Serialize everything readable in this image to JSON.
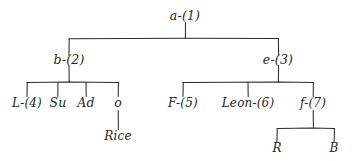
{
  "diagram": {
    "style": "handwritten pen on white paper",
    "ink_color": "#262626",
    "background_color": "#ffffff",
    "nodes": [
      {
        "id": "n1",
        "label": "a-(1)",
        "x": 185,
        "y": 16,
        "level": 0
      },
      {
        "id": "n2",
        "label": "b-(2)",
        "x": 69,
        "y": 60,
        "level": 1
      },
      {
        "id": "n3",
        "label": "e-(3)",
        "x": 278,
        "y": 60,
        "level": 1
      },
      {
        "id": "n4",
        "label": "L-(4)",
        "x": 27,
        "y": 103,
        "level": 2
      },
      {
        "id": "n5",
        "label": "Su",
        "x": 58,
        "y": 103,
        "level": 2
      },
      {
        "id": "n6",
        "label": "Ad",
        "x": 86,
        "y": 103,
        "level": 2
      },
      {
        "id": "n7",
        "label": "o",
        "x": 118,
        "y": 103,
        "level": 2
      },
      {
        "id": "n8",
        "label": "Rice",
        "x": 118,
        "y": 140,
        "level": 3
      },
      {
        "id": "n9",
        "label": "F-(5)",
        "x": 183,
        "y": 103,
        "level": 2
      },
      {
        "id": "n10",
        "label": "Leon-(6)",
        "x": 248,
        "y": 103,
        "level": 2
      },
      {
        "id": "n11",
        "label": "f-(7)",
        "x": 313,
        "y": 103,
        "level": 2
      },
      {
        "id": "n12",
        "label": "R",
        "x": 277,
        "y": 148,
        "level": 3
      },
      {
        "id": "n13",
        "label": "B",
        "x": 334,
        "y": 148,
        "level": 3
      }
    ],
    "edges": [
      {
        "from": "n1",
        "to": "n2"
      },
      {
        "from": "n1",
        "to": "n3"
      },
      {
        "from": "n2",
        "to": "n4"
      },
      {
        "from": "n2",
        "to": "n5"
      },
      {
        "from": "n2",
        "to": "n6"
      },
      {
        "from": "n2",
        "to": "n7"
      },
      {
        "from": "n7",
        "to": "n8"
      },
      {
        "from": "n3",
        "to": "n9"
      },
      {
        "from": "n3",
        "to": "n10"
      },
      {
        "from": "n3",
        "to": "n11"
      },
      {
        "from": "n11",
        "to": "n12"
      },
      {
        "from": "n11",
        "to": "n13"
      }
    ]
  }
}
